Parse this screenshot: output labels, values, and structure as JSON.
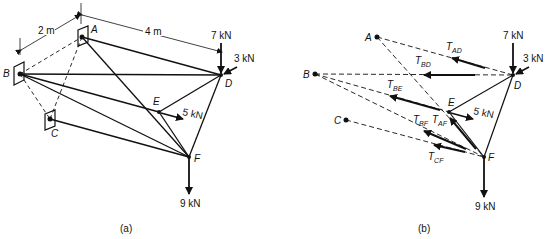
{
  "figure": {
    "panel_a": {
      "caption": "(a)",
      "dimensions": {
        "ab": "2 m",
        "ad": "4 m"
      },
      "nodes": {
        "A": "A",
        "B": "B",
        "C": "C",
        "D": "D",
        "E": "E",
        "F": "F"
      },
      "loads": {
        "d_vertical": "7 kN",
        "d_side": "3 kN",
        "e": "5 kN",
        "f": "9 kN"
      }
    },
    "panel_b": {
      "caption": "(b)",
      "nodes": {
        "A": "A",
        "B": "B",
        "C": "C",
        "D": "D",
        "E": "E",
        "F": "F"
      },
      "loads": {
        "d_vertical": "7 kN",
        "d_side": "3 kN",
        "e": "5 kN",
        "f": "9 kN"
      },
      "tensions": [
        {
          "main": "T",
          "sub": "AD"
        },
        {
          "main": "T",
          "sub": "BD"
        },
        {
          "main": "T",
          "sub": "BE"
        },
        {
          "main": "T",
          "sub": "BF"
        },
        {
          "main": "T",
          "sub": "AF"
        },
        {
          "main": "T",
          "sub": "CF"
        }
      ]
    }
  }
}
